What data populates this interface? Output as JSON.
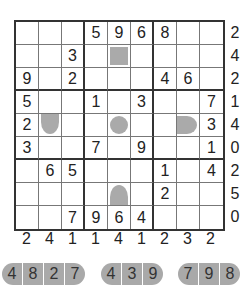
{
  "puzzle": {
    "grid": [
      [
        "",
        "",
        "",
        "5",
        "9",
        "6",
        "8",
        "",
        ""
      ],
      [
        "",
        "",
        "3",
        "",
        "",
        "",
        "",
        "",
        ""
      ],
      [
        "9",
        "",
        "2",
        "",
        "",
        "",
        "4",
        "6",
        ""
      ],
      [
        "5",
        "",
        "",
        "1",
        "",
        "3",
        "",
        "",
        "7"
      ],
      [
        "2",
        "",
        "",
        "",
        "",
        "",
        "",
        "",
        "3"
      ],
      [
        "3",
        "",
        "",
        "7",
        "",
        "9",
        "",
        "",
        "1"
      ],
      [
        "",
        "6",
        "5",
        "",
        "",
        "",
        "1",
        "",
        "4"
      ],
      [
        "",
        "",
        "",
        "",
        "",
        "",
        "2",
        "",
        ""
      ],
      [
        "",
        "",
        "7",
        "9",
        "6",
        "4",
        "",
        "",
        ""
      ]
    ],
    "shapes": [
      {
        "row": 1,
        "col": 4,
        "type": "square"
      },
      {
        "row": 4,
        "col": 1,
        "type": "cap-down"
      },
      {
        "row": 4,
        "col": 4,
        "type": "circle"
      },
      {
        "row": 4,
        "col": 7,
        "type": "cap-right"
      },
      {
        "row": 7,
        "col": 4,
        "type": "cap-up"
      }
    ],
    "row_clues": [
      "2",
      "4",
      "2",
      "1",
      "4",
      "0",
      "2",
      "5",
      "0"
    ],
    "col_clues": [
      "2",
      "4",
      "1",
      "1",
      "4",
      "1",
      "2",
      "3",
      "2"
    ],
    "pieces": [
      {
        "tiles": [
          "4",
          "8",
          "2",
          "7"
        ]
      },
      {
        "tiles": [
          "4",
          "3",
          "9"
        ]
      },
      {
        "tiles": [
          "7",
          "9",
          "8"
        ]
      }
    ],
    "colors": {
      "shape_fill": "#aaaaaa",
      "grid_line": "#333333",
      "text": "#222222"
    }
  }
}
